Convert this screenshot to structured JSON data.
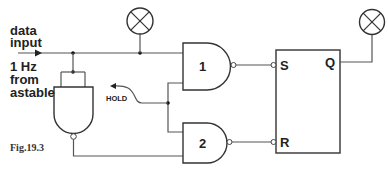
{
  "figure": {
    "caption": "Fig.19.3",
    "labels": {
      "data_input_line1": "data",
      "data_input_line2": "input",
      "clock_line1": "1 Hz",
      "clock_line2": "from",
      "clock_line3": "astable",
      "hold": "HOLD"
    },
    "gates": [
      {
        "id": "gate-1",
        "type": "NAND",
        "label": "1"
      },
      {
        "id": "gate-2",
        "type": "NAND",
        "label": "2"
      },
      {
        "id": "gate-inverter",
        "type": "NAND (inverter, inputs tied)",
        "label": ""
      }
    ],
    "flipflop": {
      "type": "S-R latch",
      "inputs": {
        "set": "S",
        "reset": "R"
      },
      "output": "Q"
    },
    "indicators": [
      {
        "id": "lamp-data",
        "type": "lamp",
        "connected_to": "data input"
      },
      {
        "id": "lamp-q",
        "type": "lamp",
        "connected_to": "Q"
      }
    ],
    "colors": {
      "line": "#555555",
      "outline": "#333333",
      "text": "#222222"
    }
  }
}
